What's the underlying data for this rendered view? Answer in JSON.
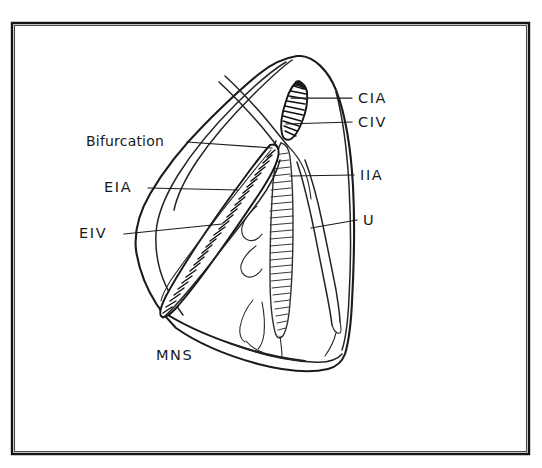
{
  "figure": {
    "kind": "anatomical-line-drawing",
    "style": "hand-drawn-ink-sketch",
    "background_color": "#ffffff",
    "ink_color": "#1a1a1a",
    "frame": {
      "present": true,
      "stroke_color": "#141414",
      "x": 11,
      "y": 22,
      "width": 519,
      "height": 433
    }
  },
  "labels": {
    "right_side": [
      {
        "id": "cia",
        "text": "CIA",
        "meaning": "common-iliac-artery",
        "x": 358,
        "y": 103,
        "leader_from_x": 352,
        "leader_from_y": 98,
        "leader_to_x": 291,
        "leader_to_y": 98
      },
      {
        "id": "civ",
        "text": "CIV",
        "meaning": "common-iliac-vein",
        "x": 358,
        "y": 127,
        "leader_from_x": 352,
        "leader_from_y": 122,
        "leader_to_x": 286,
        "leader_to_y": 124
      },
      {
        "id": "iia",
        "text": "IIA",
        "meaning": "internal-iliac-artery",
        "x": 360,
        "y": 180,
        "leader_from_x": 354,
        "leader_from_y": 175,
        "leader_to_x": 290,
        "leader_to_y": 176
      },
      {
        "id": "u",
        "text": "U",
        "meaning": "ureter",
        "x": 363,
        "y": 225,
        "leader_from_x": 357,
        "leader_from_y": 220,
        "leader_to_x": 311,
        "leader_to_y": 228
      }
    ],
    "left_side": [
      {
        "id": "bifurcation",
        "text": "Bifurcation",
        "meaning": "iliac-bifurcation",
        "x": 86,
        "y": 146,
        "leader_from_x": 187,
        "leader_from_y": 142,
        "leader_to_x": 272,
        "leader_to_y": 148
      },
      {
        "id": "eia",
        "text": "EIA",
        "meaning": "external-iliac-artery",
        "x": 104,
        "y": 192,
        "leader_from_x": 148,
        "leader_from_y": 188,
        "leader_to_x": 238,
        "leader_to_y": 190
      },
      {
        "id": "eiv",
        "text": "EIV",
        "meaning": "external-iliac-vein",
        "x": 79,
        "y": 238,
        "leader_from_x": 124,
        "leader_from_y": 234,
        "leader_to_x": 222,
        "leader_to_y": 224
      }
    ],
    "bottom": [
      {
        "id": "mns",
        "text": "MNS",
        "meaning": "medial-nerve-structure",
        "x": 156,
        "y": 360
      }
    ]
  },
  "structures": [
    {
      "id": "cia-vessel",
      "name": "common-iliac-artery-vessel",
      "hatching": "dense-dark",
      "orientation": "near-vertical-upper"
    },
    {
      "id": "civ-vessel",
      "name": "common-iliac-vein-vessel",
      "hatching": "dense-dark",
      "orientation": "near-vertical-upper"
    },
    {
      "id": "iia-vessel",
      "name": "internal-iliac-artery-vessel",
      "hatching": "ladder-light",
      "orientation": "vertical-central"
    },
    {
      "id": "eia-vessel",
      "name": "external-iliac-artery-vessel",
      "hatching": "dense-dark",
      "orientation": "diagonal-left"
    },
    {
      "id": "eiv-vessel",
      "name": "external-iliac-vein-vessel",
      "hatching": "dense-dark",
      "orientation": "diagonal-left"
    },
    {
      "id": "ureter",
      "name": "ureter-strand",
      "hatching": "none",
      "orientation": "vertical-right"
    },
    {
      "id": "specimen-outline",
      "name": "pelvic-sidewall-specimen-outline",
      "hatching": "none",
      "orientation": "closed-contour"
    },
    {
      "id": "mns-fascia",
      "name": "medial-nerve-structure-fascia-folds",
      "hatching": "none",
      "orientation": "wavy-central"
    }
  ]
}
